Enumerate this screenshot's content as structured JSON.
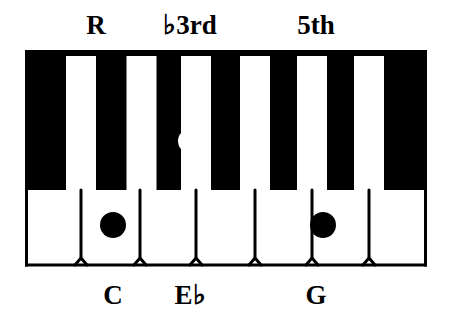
{
  "diagram": {
    "title_alt": "C minor chord voicing on piano keyboard",
    "colors": {
      "key_black": "#000000",
      "key_white": "#FFFFFF",
      "outline": "#000000",
      "marker_on_white": "#000000",
      "marker_on_black": "#FFFFFF",
      "background": "#FFFFFF"
    }
  },
  "top_labels": [
    {
      "text": "R",
      "x": 96,
      "note": "C",
      "name": "root"
    },
    {
      "text": "3rd",
      "x": 190,
      "prefix": "♭",
      "note": "Eb",
      "name": "flat-third"
    },
    {
      "text": "5th",
      "x": 316,
      "note": "G",
      "name": "fifth"
    }
  ],
  "bottom_labels": [
    {
      "text": "C",
      "x": 113,
      "name": "note-c"
    },
    {
      "text": "E",
      "suffix": "♭",
      "x": 190,
      "name": "note-e-flat"
    },
    {
      "text": "G",
      "x": 316,
      "name": "note-g"
    }
  ],
  "keyboard": {
    "white_keys": [
      {
        "name": "C",
        "marked": true,
        "marker": "black-dot"
      },
      {
        "name": "D",
        "marked": false,
        "marker": ""
      },
      {
        "name": "E",
        "marked": false,
        "marker": ""
      },
      {
        "name": "F",
        "marked": false,
        "marker": ""
      },
      {
        "name": "G",
        "marked": true,
        "marker": "black-dot"
      },
      {
        "name": "A",
        "marked": false,
        "marker": ""
      },
      {
        "name": "B",
        "marked": false,
        "marker": ""
      }
    ],
    "black_keys": [
      {
        "name": "C#/Db",
        "marked": false,
        "marker": ""
      },
      {
        "name": "D#/Eb",
        "marked": true,
        "marker": "white-dot"
      },
      {
        "name": "F#/Gb",
        "marked": false,
        "marker": ""
      },
      {
        "name": "G#/Ab",
        "marked": false,
        "marker": ""
      },
      {
        "name": "A#/Bb",
        "marked": false,
        "marker": ""
      }
    ],
    "markers": [
      {
        "id": "marker-c",
        "cx": 113,
        "cy": 225,
        "r": 13,
        "fill": "#000000",
        "note": "C"
      },
      {
        "id": "marker-eb",
        "cx": 190,
        "cy": 141,
        "r": 12,
        "fill": "#FFFFFF",
        "note": "Eb"
      },
      {
        "id": "marker-g",
        "cx": 323,
        "cy": 225,
        "r": 13,
        "fill": "#000000",
        "note": "G"
      }
    ]
  }
}
